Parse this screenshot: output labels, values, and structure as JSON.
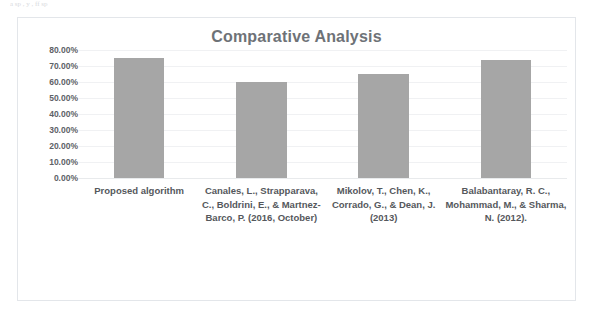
{
  "page": {
    "scan_sliver_text": "a  sp  , y , ff     sp"
  },
  "chart_data": {
    "type": "bar",
    "title": "Comparative Analysis",
    "xlabel": "",
    "ylabel": "",
    "categories": [
      "Proposed algorithm",
      "Canales, L., Strapparava, C., Boldrini, E., & Martnez-Barco, P. (2016, October)",
      "Mikolov, T., Chen, K., Corrado, G., & Dean, J. (2013)",
      "Balabantaray, R. C., Mohammad, M., & Sharma, N. (2012)."
    ],
    "values": [
      75.0,
      60.0,
      65.0,
      73.5
    ],
    "value_labels": [
      "75.00%",
      "60.00%",
      "65.00%",
      "73.50%"
    ],
    "ylim": [
      0,
      80
    ],
    "ytick_values": [
      80,
      70,
      60,
      50,
      40,
      30,
      20,
      10,
      0
    ],
    "ytick_labels": [
      "80.00%",
      "70.00%",
      "60.00%",
      "50.00%",
      "40.00%",
      "30.00%",
      "20.00%",
      "10.00%",
      "0.00%"
    ],
    "grid": true,
    "legend": false,
    "legend_position": "none",
    "bar_color": "#a6a6a6",
    "title_color": "#6e7277",
    "gridline_color": "#f0f1f3",
    "frame_border_color": "#e3e6ea",
    "background": "#ffffff"
  }
}
